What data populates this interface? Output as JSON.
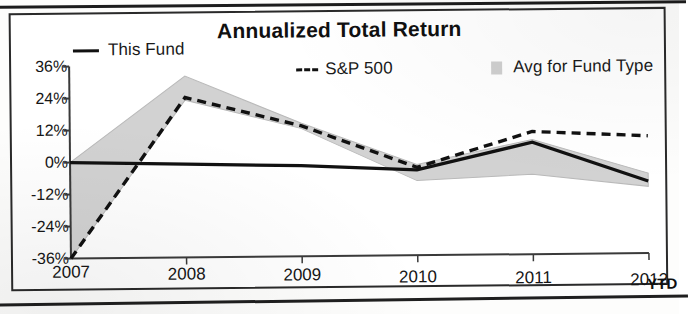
{
  "chart_data": {
    "type": "line",
    "title": "Annualized Total Return",
    "xlabel": "",
    "ylabel": "",
    "categories": [
      "2007",
      "2008",
      "2009",
      "2010",
      "2011",
      "2012"
    ],
    "x_axis_note": "YTD",
    "ylim": [
      -36,
      36
    ],
    "ytick_labels": [
      "36%",
      "24%",
      "12%",
      "0%",
      "-12%",
      "-24%",
      "-36%"
    ],
    "ytick_values": [
      36,
      24,
      12,
      0,
      -12,
      -24,
      -36
    ],
    "grid": false,
    "legend_position": "top",
    "series": [
      {
        "name": "This Fund",
        "style": "solid",
        "color": "#111111",
        "values": [
          0,
          -1,
          -2,
          -4,
          6,
          -9
        ]
      },
      {
        "name": "S&P 500",
        "style": "dashed",
        "color": "#111111",
        "values": [
          -36,
          24,
          13,
          -3,
          10,
          8
        ]
      },
      {
        "name": "Avg for Fund Type",
        "style": "shaded-band",
        "color": "#d2d2d2",
        "upper": [
          0,
          32,
          14,
          -2,
          7,
          -6
        ],
        "lower": [
          -36,
          23,
          12,
          -8,
          -6,
          -11
        ]
      }
    ]
  },
  "legend": {
    "this_fund": "This Fund",
    "sp500": "S&P 500",
    "avg_fund_type": "Avg for Fund Type"
  },
  "colors": {
    "line": "#111111",
    "band": "#d2d2d2",
    "axis": "#3a3a3a",
    "frame": "#2a2a2a",
    "text": "#161616"
  }
}
